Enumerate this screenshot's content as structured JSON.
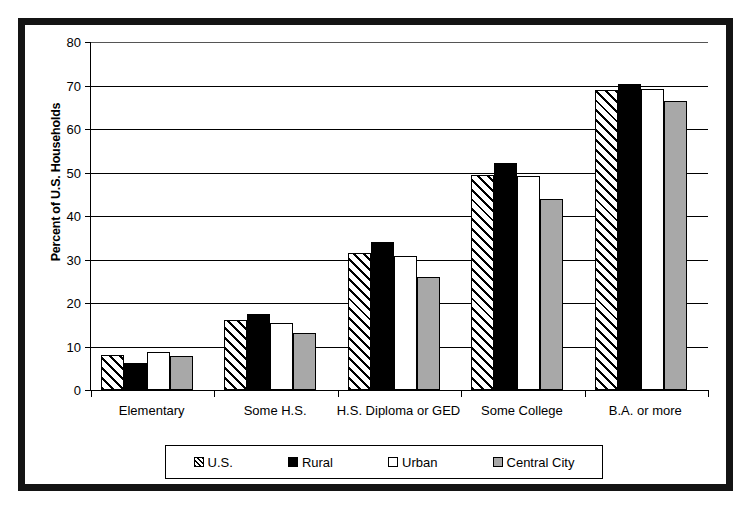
{
  "chart_data": {
    "type": "bar",
    "title": "",
    "xlabel": "",
    "ylabel": "Percent of U.S. Households",
    "ylim": [
      0,
      80
    ],
    "yticks": [
      0,
      10,
      20,
      30,
      40,
      50,
      60,
      70,
      80
    ],
    "grid": true,
    "legend_position": "bottom",
    "categories": [
      "Elementary",
      "Some H.S.",
      "H.S. Diploma or GED",
      "Some College",
      "B.A. or more"
    ],
    "series": [
      {
        "name": "U.S.",
        "pattern": "diagonal-hatch",
        "color": "#ffffff",
        "values": [
          8,
          16,
          31.5,
          49.5,
          69
        ]
      },
      {
        "name": "Rural",
        "pattern": "solid-black",
        "color": "#000000",
        "values": [
          6.3,
          17.5,
          34,
          52.3,
          70.3
        ]
      },
      {
        "name": "Urban",
        "pattern": "white",
        "color": "#ffffff",
        "values": [
          8.8,
          15.3,
          30.8,
          49.2,
          69.2
        ]
      },
      {
        "name": "Central City",
        "pattern": "gray",
        "color": "#a8a8a8",
        "values": [
          7.8,
          13,
          26,
          44,
          66.5
        ]
      }
    ]
  },
  "legend": {
    "items": [
      {
        "label": "U.S."
      },
      {
        "label": "Rural"
      },
      {
        "label": "Urban"
      },
      {
        "label": "Central City"
      }
    ]
  }
}
